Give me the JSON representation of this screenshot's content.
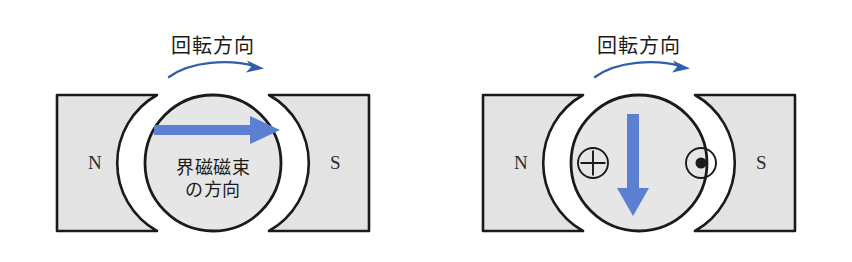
{
  "figure": {
    "background_color": "#ffffff",
    "panels": [
      {
        "id": "left",
        "rotation_label": "回転方向",
        "rotation_arrow": "curved-arrow-right",
        "pole_left_label": "N",
        "pole_right_label": "S",
        "armature_arrow": "thick-arrow-right",
        "flux_caption_line1": "界磁磁束",
        "flux_caption_line2": "の方向"
      },
      {
        "id": "right",
        "rotation_label": "回転方向",
        "rotation_arrow": "curved-arrow-right",
        "pole_left_label": "N",
        "pole_right_label": "S",
        "armature_arrow": "thick-arrow-down",
        "current_in_symbol": "⊕",
        "current_out_symbol": "⊙"
      }
    ]
  },
  "colors": {
    "arrow_blue": "#5b7fd1",
    "rotation_arrow_blue": "#2f5fa8",
    "pole_fill": "#e3e3e3",
    "armature_fill": "#e6e6e6",
    "outline": "#1a1a1a",
    "text": "#1b1b1b"
  }
}
